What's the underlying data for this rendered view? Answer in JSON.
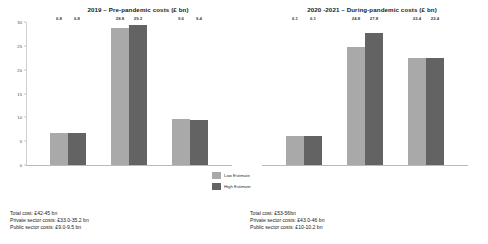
{
  "chart_data": [
    {
      "type": "bar",
      "title": "2019 – Pre-pandemic costs (£ bn)",
      "xlabel": "",
      "ylabel": "",
      "ylim": [
        0,
        30
      ],
      "yticks": [
        0,
        5,
        10,
        15,
        20,
        25,
        30
      ],
      "ytick_labels": [
        "0",
        "5",
        "10",
        "15",
        "20",
        "25",
        "30"
      ],
      "grid": false,
      "legend_position": "center",
      "categories": [
        "Group 1",
        "Group 2",
        "Group 3"
      ],
      "series": [
        {
          "name": "Low Estimate",
          "values": [
            6.8,
            28.8,
            9.6
          ],
          "color": "#a9a9a9"
        },
        {
          "name": "High Estimate",
          "values": [
            6.8,
            29.3,
            9.4
          ],
          "color": "#636363"
        }
      ],
      "bar_labels": [
        [
          "6.8",
          "6.8"
        ],
        [
          "28.8",
          "29.3"
        ],
        [
          "9.6",
          "9.4"
        ]
      ]
    },
    {
      "type": "bar",
      "title": "2020 -2021 – During-pandemic costs (£ bn)",
      "xlabel": "",
      "ylabel": "",
      "ylim": [
        0,
        30
      ],
      "yticks": [
        0,
        5,
        10,
        15,
        20,
        25,
        30
      ],
      "ytick_labels": [
        "0",
        "5",
        "10",
        "15",
        "20",
        "25",
        "30"
      ],
      "grid": false,
      "legend_position": "center",
      "categories": [
        "Group 1",
        "Group 2",
        "Group 3"
      ],
      "series": [
        {
          "name": "Low Estimate",
          "values": [
            6.1,
            24.8,
            22.4
          ],
          "color": "#a9a9a9"
        },
        {
          "name": "High Estimate",
          "values": [
            6.1,
            27.8,
            22.4
          ],
          "color": "#636363"
        }
      ],
      "bar_labels": [
        [
          "6.1",
          "6.1"
        ],
        [
          "24.8",
          "27.8"
        ],
        [
          "22.4",
          "22.4"
        ]
      ]
    }
  ],
  "legend": {
    "items": [
      {
        "label": "Low Estimate",
        "color": "#a9a9a9"
      },
      {
        "label": "High Estimate",
        "color": "#636363"
      }
    ]
  },
  "footnotes": {
    "left": [
      "Total cost: £42-45 bn",
      "Private sector costs: £33.0-35.2 bn",
      "Public sector costs: £9.0-9.5 bn"
    ],
    "right": [
      "Total cost: £53-56bn",
      "Private sector costs: £43.0-46 bn",
      "Public sector costs: £10-10.2 bn"
    ]
  }
}
